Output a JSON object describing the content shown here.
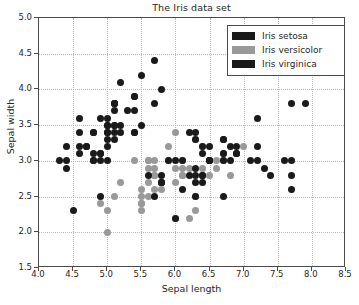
{
  "chart_data": {
    "type": "scatter",
    "title": "The Iris data set",
    "xlabel": "Sepal length",
    "ylabel": "Sepal width",
    "xlim": [
      4.0,
      8.5
    ],
    "ylim": [
      1.5,
      5.0
    ],
    "xticks": [
      "4.0",
      "4.5",
      "5.0",
      "5.5",
      "6.0",
      "6.5",
      "7.0",
      "7.5",
      "8.0",
      "8.5"
    ],
    "yticks": [
      "1.5",
      "2.0",
      "2.5",
      "3.0",
      "3.5",
      "4.0",
      "4.5",
      "5.0"
    ],
    "xtick_values": [
      4.0,
      4.5,
      5.0,
      5.5,
      6.0,
      6.5,
      7.0,
      7.5,
      8.0,
      8.5
    ],
    "ytick_values": [
      1.5,
      2.0,
      2.5,
      3.0,
      3.5,
      4.0,
      4.5,
      5.0
    ],
    "grid": true,
    "legend_position": "upper right",
    "marker_size_px": 7,
    "series": [
      {
        "name": "Iris setosa",
        "color": "#1a1a1a",
        "points": [
          [
            5.1,
            3.5
          ],
          [
            4.9,
            3.0
          ],
          [
            4.7,
            3.2
          ],
          [
            4.6,
            3.1
          ],
          [
            5.0,
            3.6
          ],
          [
            5.4,
            3.9
          ],
          [
            4.6,
            3.4
          ],
          [
            5.0,
            3.4
          ],
          [
            4.4,
            2.9
          ],
          [
            4.9,
            3.1
          ],
          [
            5.4,
            3.7
          ],
          [
            4.8,
            3.4
          ],
          [
            4.8,
            3.0
          ],
          [
            4.3,
            3.0
          ],
          [
            5.8,
            4.0
          ],
          [
            5.7,
            4.4
          ],
          [
            5.4,
            3.9
          ],
          [
            5.1,
            3.5
          ],
          [
            5.7,
            3.8
          ],
          [
            5.1,
            3.8
          ],
          [
            5.4,
            3.4
          ],
          [
            5.1,
            3.7
          ],
          [
            4.6,
            3.6
          ],
          [
            5.1,
            3.3
          ],
          [
            4.8,
            3.4
          ],
          [
            5.0,
            3.0
          ],
          [
            5.0,
            3.4
          ],
          [
            5.2,
            3.5
          ],
          [
            5.2,
            3.4
          ],
          [
            4.7,
            3.2
          ],
          [
            4.8,
            3.1
          ],
          [
            5.4,
            3.4
          ],
          [
            5.2,
            4.1
          ],
          [
            5.5,
            4.2
          ],
          [
            4.9,
            3.1
          ],
          [
            5.0,
            3.2
          ],
          [
            5.5,
            3.5
          ],
          [
            4.9,
            3.6
          ],
          [
            4.4,
            3.0
          ],
          [
            5.1,
            3.4
          ],
          [
            5.0,
            3.5
          ],
          [
            4.5,
            2.3
          ],
          [
            4.4,
            3.2
          ],
          [
            5.0,
            3.5
          ],
          [
            5.1,
            3.8
          ],
          [
            4.8,
            3.0
          ],
          [
            5.1,
            3.8
          ],
          [
            4.6,
            3.2
          ],
          [
            5.3,
            3.7
          ],
          [
            5.0,
            3.3
          ]
        ]
      },
      {
        "name": "Iris versicolor",
        "color": "#999999",
        "points": [
          [
            7.0,
            3.2
          ],
          [
            6.4,
            3.2
          ],
          [
            6.9,
            3.1
          ],
          [
            5.5,
            2.3
          ],
          [
            6.5,
            2.8
          ],
          [
            5.7,
            2.8
          ],
          [
            6.3,
            3.3
          ],
          [
            4.9,
            2.4
          ],
          [
            6.6,
            2.9
          ],
          [
            5.2,
            2.7
          ],
          [
            5.0,
            2.0
          ],
          [
            5.9,
            3.0
          ],
          [
            6.0,
            2.2
          ],
          [
            6.1,
            2.9
          ],
          [
            5.6,
            2.9
          ],
          [
            6.7,
            3.1
          ],
          [
            5.6,
            3.0
          ],
          [
            5.8,
            2.7
          ],
          [
            6.2,
            2.2
          ],
          [
            5.6,
            2.5
          ],
          [
            5.9,
            3.2
          ],
          [
            6.1,
            2.8
          ],
          [
            6.3,
            2.5
          ],
          [
            6.1,
            2.8
          ],
          [
            6.4,
            2.9
          ],
          [
            6.6,
            3.0
          ],
          [
            6.8,
            2.8
          ],
          [
            6.7,
            3.0
          ],
          [
            6.0,
            2.9
          ],
          [
            5.7,
            2.6
          ],
          [
            5.5,
            2.4
          ],
          [
            5.5,
            2.4
          ],
          [
            5.8,
            2.7
          ],
          [
            6.0,
            2.7
          ],
          [
            5.4,
            3.0
          ],
          [
            6.0,
            3.4
          ],
          [
            6.7,
            3.1
          ],
          [
            6.3,
            2.3
          ],
          [
            5.6,
            3.0
          ],
          [
            5.5,
            2.5
          ],
          [
            5.5,
            2.6
          ],
          [
            6.1,
            3.0
          ],
          [
            5.8,
            2.6
          ],
          [
            5.0,
            2.3
          ],
          [
            5.6,
            2.7
          ],
          [
            5.7,
            3.0
          ],
          [
            5.7,
            2.9
          ],
          [
            6.2,
            2.9
          ],
          [
            5.1,
            2.5
          ],
          [
            5.7,
            2.8
          ]
        ]
      },
      {
        "name": "Iris virginica",
        "color": "#1a1a1a",
        "points": [
          [
            6.3,
            3.3
          ],
          [
            5.8,
            2.7
          ],
          [
            7.1,
            3.0
          ],
          [
            6.3,
            2.9
          ],
          [
            6.5,
            3.0
          ],
          [
            7.6,
            3.0
          ],
          [
            4.9,
            2.5
          ],
          [
            7.3,
            2.9
          ],
          [
            6.7,
            2.5
          ],
          [
            7.2,
            3.6
          ],
          [
            6.5,
            3.2
          ],
          [
            6.4,
            2.7
          ],
          [
            6.8,
            3.0
          ],
          [
            5.7,
            2.5
          ],
          [
            5.8,
            2.8
          ],
          [
            6.4,
            3.2
          ],
          [
            6.5,
            3.0
          ],
          [
            7.7,
            3.8
          ],
          [
            7.7,
            2.6
          ],
          [
            6.0,
            2.2
          ],
          [
            6.9,
            3.2
          ],
          [
            5.6,
            2.8
          ],
          [
            7.7,
            2.8
          ],
          [
            6.3,
            2.7
          ],
          [
            6.7,
            3.3
          ],
          [
            7.2,
            3.2
          ],
          [
            6.2,
            2.8
          ],
          [
            6.1,
            3.0
          ],
          [
            6.4,
            2.8
          ],
          [
            7.2,
            3.0
          ],
          [
            7.4,
            2.8
          ],
          [
            7.9,
            3.8
          ],
          [
            6.4,
            2.8
          ],
          [
            6.3,
            2.8
          ],
          [
            6.1,
            2.6
          ],
          [
            7.7,
            3.0
          ],
          [
            6.3,
            3.4
          ],
          [
            6.4,
            3.1
          ],
          [
            6.0,
            3.0
          ],
          [
            6.9,
            3.1
          ],
          [
            6.7,
            3.1
          ],
          [
            6.9,
            3.1
          ],
          [
            5.8,
            2.7
          ],
          [
            6.8,
            3.2
          ],
          [
            6.7,
            3.3
          ],
          [
            6.7,
            3.0
          ],
          [
            6.3,
            2.5
          ],
          [
            6.5,
            3.0
          ],
          [
            6.2,
            3.4
          ],
          [
            5.9,
            3.0
          ]
        ]
      }
    ]
  }
}
